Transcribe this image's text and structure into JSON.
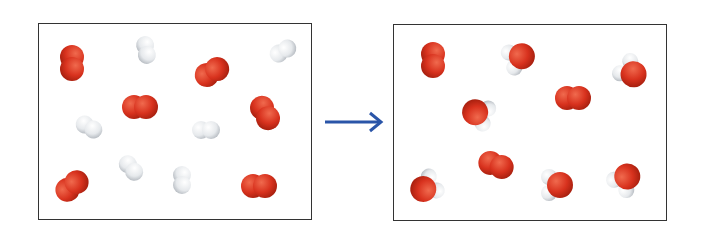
{
  "diagram": {
    "colors": {
      "oxygen": "#d8321e",
      "hydrogen": "#e8ebee",
      "arrow": "#2a55a8",
      "border": "#333333"
    },
    "reactants": {
      "o2": [
        [
          72,
          63,
          90
        ],
        [
          212,
          72,
          -30
        ],
        [
          140,
          107,
          0
        ],
        [
          265,
          113,
          60
        ],
        [
          72,
          186,
          -40
        ],
        [
          259,
          186,
          0
        ]
      ],
      "h2": [
        [
          146,
          50,
          80
        ],
        [
          283,
          51,
          -30
        ],
        [
          89,
          127,
          30
        ],
        [
          206,
          130,
          0
        ],
        [
          131,
          168,
          50
        ],
        [
          182,
          180,
          90
        ]
      ]
    },
    "products": {
      "o2": [
        [
          433,
          60,
          90
        ],
        [
          573,
          98,
          0
        ],
        [
          496,
          165,
          20
        ]
      ],
      "h2o": [
        [
          520,
          57,
          -20
        ],
        [
          632,
          73,
          40
        ],
        [
          477,
          113,
          200
        ],
        [
          425,
          188,
          150
        ],
        [
          558,
          185,
          0
        ],
        [
          626,
          178,
          -50
        ]
      ]
    }
  }
}
